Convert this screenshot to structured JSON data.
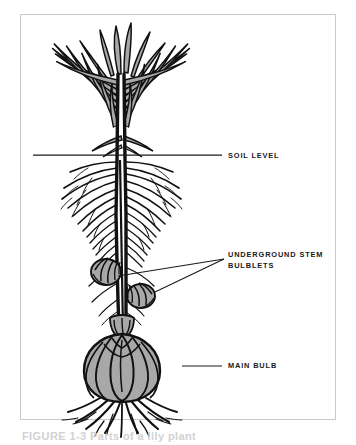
{
  "figure": {
    "background_color": "#ffffff",
    "border_color": "#c9c9c9",
    "ink_color": "#111111",
    "fill_color": "#a8a8a8"
  },
  "labels": {
    "soil_level": "SOIL LEVEL",
    "underground_stem": "UNDERGROUND STEM",
    "bulblets": "BULBLETS",
    "main_bulb": "MAIN BULB"
  },
  "caption": {
    "clipped_text": "FIGURE 1-3   Parts of a lily plant"
  },
  "diagram_parts": [
    {
      "name": "leaves",
      "description": "narrow lance-shaped leaves radiating from upper stem"
    },
    {
      "name": "stem",
      "description": "vertical central stem"
    },
    {
      "name": "soil-level-line",
      "description": "horizontal rule marking ground surface"
    },
    {
      "name": "roots",
      "description": "feathery contractile roots along underground stem"
    },
    {
      "name": "bulblets",
      "description": "two small scaled bulblets on underground stem"
    },
    {
      "name": "main-bulb",
      "description": "large scaled bulb at base"
    },
    {
      "name": "basal-roots",
      "description": "thick roots spreading from bulb base"
    }
  ]
}
